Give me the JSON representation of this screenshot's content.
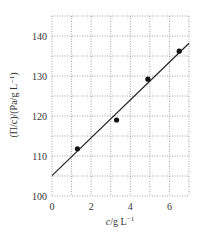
{
  "chart_data": {
    "type": "scatter",
    "title": "",
    "xlabel": "c/g L⁻¹",
    "ylabel": "(Π/c)/(Pa/g L⁻¹)",
    "xlim": [
      0,
      7
    ],
    "ylim": [
      100,
      145
    ],
    "xticks": [
      0,
      2,
      4,
      6
    ],
    "yticks": [
      100,
      110,
      120,
      130,
      140
    ],
    "grid": true,
    "grid_style": "dotted",
    "x_grid_step": 1,
    "y_grid_step": 5,
    "series": [
      {
        "name": "data",
        "type": "scatter",
        "x": [
          1.3,
          3.3,
          4.9,
          6.5
        ],
        "y": [
          111.8,
          119.0,
          129.2,
          136.2
        ]
      },
      {
        "name": "fit",
        "type": "line",
        "x": [
          0,
          7
        ],
        "y": [
          105.1,
          138.2
        ]
      }
    ]
  },
  "labels": {
    "xlabel_var": "c",
    "xlabel_unit": "/g L",
    "xlabel_exp": "−1",
    "ylabel_text": "(Π/c)/(Pa/g L⁻¹)"
  }
}
